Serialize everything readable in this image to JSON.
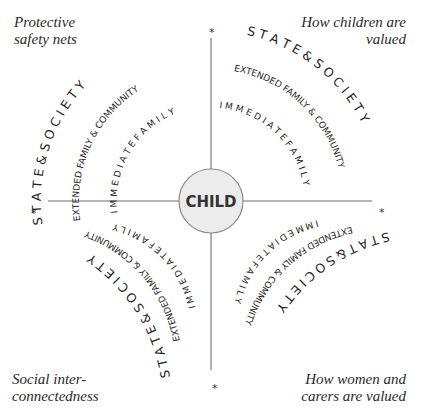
{
  "diagram": {
    "center_label": "CHILD",
    "center_fill": "#ececec",
    "center_stroke": "#8a8a8a",
    "corner_labels": {
      "top_left": [
        "Protective",
        "safety nets"
      ],
      "top_right": [
        "How children are",
        "valued"
      ],
      "bottom_left": [
        "Social inter-",
        "connectedness"
      ],
      "bottom_right": [
        "How women and",
        "carers are valued"
      ]
    },
    "quadrants": {
      "top_left": {
        "state": "S T A T E   &   S O C I E T Y",
        "extended": "EXTENDED FAMILY & COMMUNITY",
        "immediate": "I M M E D I A T E   F A M I L Y"
      },
      "top_right": {
        "state": "S T A T E & S O C I E T Y",
        "extended": "EXTENDED FAMILY & COMMUNITY",
        "immediate": "I M M E D I A T E   F A M I L Y"
      },
      "bottom_left": {
        "state": "S T A T E & S O C I E T Y",
        "extended": "EXTENDED FAMILY & COMMUNITY",
        "immediate": "I M M E D I A T E   F A M I L Y"
      },
      "bottom_right": {
        "state": "S T A T & S O C I E T Y",
        "extended": "EXTENDED FAMILY & COMMUNITY",
        "immediate": "I M M E D I A T E   F A M I L Y"
      }
    },
    "axis_end_marker": "*"
  }
}
